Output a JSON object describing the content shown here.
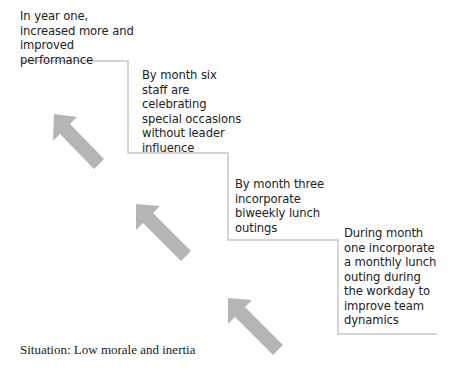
{
  "diagram": {
    "steps": [
      {
        "label": "In year one, increased more and improved performance"
      },
      {
        "label": "By month six staff are celebrating special occasions without leader influence"
      },
      {
        "label": "By month three incorporate biweekly lunch outings"
      },
      {
        "label": "During month one incorporate a monthly lunch outing during the workday to improve team dynamics"
      }
    ],
    "situation": "Situation: Low morale and inertia",
    "colors": {
      "arrow": "#b5b5b5",
      "staircase_line": "#c8c8c8",
      "text": "#222222"
    },
    "icons": [
      "arrow-up-left-icon",
      "arrow-up-left-icon",
      "arrow-up-left-icon"
    ]
  }
}
